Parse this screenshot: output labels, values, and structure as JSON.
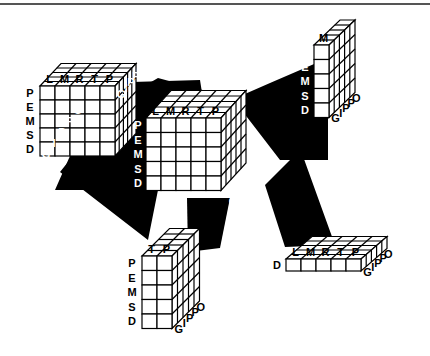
{
  "diagram": {
    "type": "olap-data-cube-projections",
    "dimensions": {
      "columns": [
        "L",
        "M",
        "R",
        "T",
        "P"
      ],
      "rows": [
        "P",
        "E",
        "M",
        "S",
        "D"
      ],
      "depth": [
        "G",
        "I",
        "P",
        "P",
        "O"
      ]
    },
    "main_cube": {
      "columns": [
        "L",
        "M",
        "R",
        "T",
        "P"
      ],
      "rows": [
        "P",
        "E",
        "M",
        "S",
        "D"
      ],
      "depth": [
        "G",
        "I",
        "P",
        "P",
        "O"
      ]
    },
    "sub_cubes": [
      {
        "id": "top-left",
        "columns": [
          "L",
          "M",
          "R",
          "T",
          "P"
        ],
        "rows": [
          "P",
          "E",
          "M",
          "S",
          "D"
        ],
        "depth": [
          "G",
          "I",
          "P",
          "P",
          "O"
        ]
      },
      {
        "id": "top-right",
        "columns": [
          "M"
        ],
        "rows": [
          "P",
          "E",
          "M",
          "S",
          "D"
        ],
        "depth": [
          "G",
          "I",
          "P",
          "P",
          "O"
        ]
      },
      {
        "id": "bottom-left",
        "columns": [
          "T",
          "P"
        ],
        "rows": [
          "P",
          "E",
          "M",
          "S",
          "D"
        ],
        "depth": [
          "G",
          "I",
          "P",
          "P",
          "O"
        ]
      },
      {
        "id": "bottom-right",
        "columns": [
          "L",
          "M",
          "R",
          "T",
          "P"
        ],
        "rows": [
          "D"
        ],
        "depth": [
          "G",
          "I",
          "P",
          "P",
          "O"
        ]
      }
    ]
  }
}
